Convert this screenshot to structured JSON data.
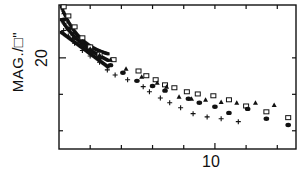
{
  "chart_data": {
    "type": "scatter",
    "title": "",
    "xlabel": "",
    "ylabel": "MAG./□\"",
    "x_tick_labels": [
      "10"
    ],
    "y_tick_labels": [
      "20"
    ],
    "xlim": [
      0,
      15.2
    ],
    "ylim": [
      22.5,
      18.55
    ],
    "y_inverted": true,
    "x_ticks": [
      2,
      4,
      6,
      8,
      10,
      12,
      14
    ],
    "y_ticks": [
      20,
      21,
      22
    ],
    "grid": false,
    "legend": null,
    "series": [
      {
        "name": "squares",
        "marker": "open-square",
        "x": [
          0.3,
          0.6,
          1.0,
          1.5,
          2.0,
          2.6,
          3.5,
          5.1,
          5.6,
          6.2,
          6.8,
          7.4,
          8.2,
          8.9,
          9.9,
          10.9,
          12.0,
          13.3,
          14.7
        ],
        "y": [
          18.6,
          18.85,
          19.15,
          19.45,
          19.7,
          19.9,
          20.05,
          20.36,
          20.49,
          20.6,
          20.74,
          20.82,
          20.93,
          20.99,
          21.04,
          21.15,
          21.32,
          21.48,
          21.64
        ]
      },
      {
        "name": "triangles",
        "marker": "filled-triangle",
        "x": [
          0.3,
          0.6,
          1.0,
          1.5,
          2.0,
          2.6,
          3.3,
          4.3,
          5.3,
          6.3,
          6.9,
          7.7,
          8.5,
          9.4,
          10.4,
          11.4,
          12.6,
          13.8
        ],
        "y": [
          18.75,
          19.0,
          19.3,
          19.55,
          19.75,
          19.92,
          20.05,
          20.3,
          20.52,
          20.68,
          20.79,
          21.07,
          21.12,
          21.15,
          21.21,
          21.23,
          21.23,
          21.29
        ]
      },
      {
        "name": "circles",
        "marker": "filled-circle",
        "x": [
          0.3,
          0.6,
          1.0,
          1.5,
          2.0,
          2.6,
          3.3,
          4.1,
          5.0,
          6.0,
          6.8,
          8.3,
          9.0,
          10.0,
          10.9,
          12.1,
          13.3,
          14.7
        ],
        "y": [
          18.95,
          19.2,
          19.45,
          19.65,
          19.85,
          20.0,
          20.2,
          20.41,
          20.63,
          20.77,
          20.9,
          21.12,
          21.23,
          21.34,
          21.51,
          21.4,
          21.67,
          21.84
        ]
      },
      {
        "name": "plus",
        "marker": "plus",
        "x": [
          0.3,
          0.6,
          1.0,
          1.5,
          2.0,
          2.6,
          3.1,
          3.6,
          4.4,
          5.4,
          5.8,
          6.5,
          7.1,
          7.8,
          8.6,
          9.5,
          10.4,
          11.5
        ],
        "y": [
          19.25,
          19.4,
          19.6,
          19.8,
          19.95,
          20.12,
          20.33,
          20.47,
          20.6,
          20.79,
          20.93,
          21.1,
          21.23,
          21.37,
          21.53,
          21.62,
          21.67,
          21.75
        ]
      }
    ]
  },
  "axes": {
    "ylabel": "MAG./□\"",
    "ytick20": "20",
    "xtick10": "10"
  }
}
